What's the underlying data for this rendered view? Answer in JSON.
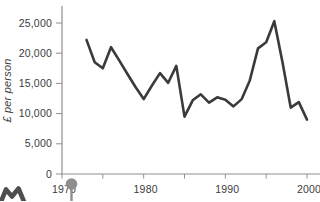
{
  "chart_data": {
    "type": "line",
    "title": "",
    "xlabel": "",
    "ylabel": "£ per person",
    "x": [
      1973,
      1974,
      1975,
      1976,
      1977,
      1978,
      1979,
      1980,
      1981,
      1982,
      1983,
      1984,
      1985,
      1986,
      1987,
      1988,
      1989,
      1990,
      1991,
      1992,
      1993,
      1994,
      1995,
      1996,
      1997,
      1998,
      1999,
      2000
    ],
    "values": [
      22200,
      18500,
      17500,
      21000,
      18800,
      16600,
      14400,
      12400,
      14600,
      16700,
      15100,
      17900,
      9500,
      12200,
      13200,
      11800,
      12700,
      12300,
      11200,
      12400,
      15500,
      20800,
      21800,
      25300,
      18500,
      11000,
      11900,
      9000
    ],
    "xlim": [
      1970,
      2001.5
    ],
    "ylim": [
      0,
      27500
    ],
    "grid": false,
    "legend": false,
    "x_ticks": [
      {
        "year": 1970,
        "label": "1970"
      },
      {
        "year": 1975,
        "label": ""
      },
      {
        "year": 1980,
        "label": "1980"
      },
      {
        "year": 1985,
        "label": ""
      },
      {
        "year": 1990,
        "label": "1990"
      },
      {
        "year": 1995,
        "label": ""
      },
      {
        "year": 2000,
        "label": "2000"
      }
    ],
    "y_ticks": [
      {
        "value": 0,
        "label": "0"
      },
      {
        "value": 5000,
        "label": "5,000"
      },
      {
        "value": 10000,
        "label": "10,000"
      },
      {
        "value": 15000,
        "label": "15,000"
      },
      {
        "value": 20000,
        "label": "20,000"
      },
      {
        "value": 25000,
        "label": "25,000"
      }
    ],
    "line_color": "#3a3a3e",
    "axis_color": "#8f8f8f",
    "tick_label_color": "#3b3b3d"
  },
  "decorations": {
    "pin_color": "#8e8e8e",
    "corner_glyph_color": "#4e4e4e",
    "pin_icon_name": "map-pin-icon",
    "corner_glyph_name": "letter-m-glyph"
  }
}
